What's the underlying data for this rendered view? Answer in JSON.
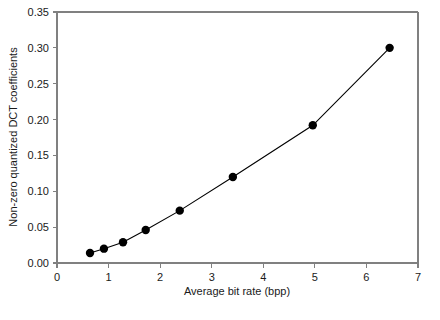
{
  "chart_data": {
    "type": "scatter",
    "title": "",
    "xlabel": "Average bit rate (bpp)",
    "ylabel": "Non-zero quantized DCT coefficients",
    "xlim": [
      0,
      7
    ],
    "ylim": [
      0.0,
      0.35
    ],
    "grid": false,
    "legend": null,
    "xticks": [
      0,
      1,
      2,
      3,
      4,
      5,
      6,
      7
    ],
    "xticklabels": [
      "0",
      "1",
      "2",
      "3",
      "4",
      "5",
      "6",
      "7"
    ],
    "yticks": [
      0.0,
      0.05,
      0.1,
      0.15,
      0.2,
      0.25,
      0.3,
      0.35
    ],
    "yticklabels": [
      "0.00",
      "0.05",
      "0.10",
      "0.15",
      "0.20",
      "0.25",
      "0.30",
      "0.35"
    ],
    "series": [
      {
        "name": "Non-zero quantized DCT coefficients",
        "marker": "filled-circle",
        "marker_color": "#000000",
        "line_color": "#000000",
        "x": [
          0.64,
          0.91,
          1.28,
          1.72,
          2.38,
          3.41,
          4.96,
          6.45
        ],
        "y": [
          0.014,
          0.02,
          0.029,
          0.046,
          0.073,
          0.12,
          0.192,
          0.3
        ]
      }
    ]
  },
  "colors": {
    "axis": "#808080",
    "data": "#000000",
    "background": "#ffffff"
  }
}
